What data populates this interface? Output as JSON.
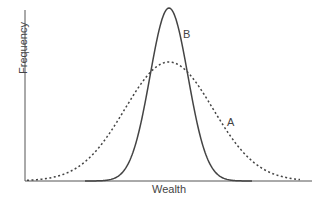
{
  "chart_data": {
    "type": "line",
    "title": "",
    "xlabel": "Wealth",
    "ylabel": "Frequency",
    "grid": false,
    "legend": "none (curves labelled inline)",
    "xlim": [
      -4,
      4
    ],
    "ylim": [
      0,
      1.05
    ],
    "x": [
      -4,
      -3.5,
      -3,
      -2.5,
      -2,
      -1.5,
      -1,
      -0.5,
      0,
      0.5,
      1,
      1.5,
      2,
      2.5,
      3,
      3.5,
      4
    ],
    "series": [
      {
        "name": "A",
        "style": "dotted",
        "description": "wide, flat normal distribution",
        "values": [
          0.01,
          0.03,
          0.07,
          0.14,
          0.25,
          0.39,
          0.53,
          0.64,
          0.68,
          0.64,
          0.53,
          0.39,
          0.25,
          0.14,
          0.07,
          0.03,
          0.01
        ]
      },
      {
        "name": "B",
        "style": "solid",
        "description": "narrow, tall normal distribution",
        "values": [
          0.0,
          0.0,
          0.0,
          0.0,
          0.01,
          0.06,
          0.25,
          0.68,
          1.0,
          0.68,
          0.25,
          0.06,
          0.01,
          0.0,
          0.0,
          0.0,
          0.0
        ]
      }
    ],
    "annotations": [
      {
        "text": "B",
        "near": "right shoulder of solid curve"
      },
      {
        "text": "A",
        "near": "right tail of dotted curve"
      }
    ]
  },
  "labels": {
    "x_axis": "Wealth",
    "y_axis": "Frequency",
    "curve_a": "A",
    "curve_b": "B"
  }
}
